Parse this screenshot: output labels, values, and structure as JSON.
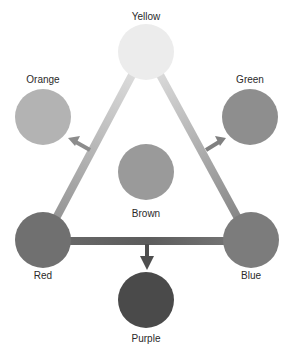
{
  "diagram": {
    "type": "color-mixing-triangle",
    "nodes": [
      {
        "id": "yellow",
        "label": "Yellow",
        "color": "#ececec",
        "role": "primary"
      },
      {
        "id": "orange",
        "label": "Orange",
        "color": "#b3b3b3",
        "role": "secondary"
      },
      {
        "id": "green",
        "label": "Green",
        "color": "#8e8e8e",
        "role": "secondary"
      },
      {
        "id": "brown",
        "label": "Brown",
        "color": "#9a9a9a",
        "role": "tertiary"
      },
      {
        "id": "red",
        "label": "Red",
        "color": "#707070",
        "role": "primary"
      },
      {
        "id": "blue",
        "label": "Blue",
        "color": "#7c7c7c",
        "role": "primary"
      },
      {
        "id": "purple",
        "label": "Purple",
        "color": "#4a4a4a",
        "role": "secondary"
      }
    ],
    "edges": [
      {
        "from": "yellow",
        "to": "red"
      },
      {
        "from": "yellow",
        "to": "blue"
      },
      {
        "from": "red",
        "to": "blue"
      }
    ],
    "arrows": [
      {
        "from_edge": "yellow-red",
        "to": "orange"
      },
      {
        "from_edge": "yellow-blue",
        "to": "green"
      },
      {
        "from_edge": "red-blue",
        "to": "purple"
      }
    ]
  }
}
